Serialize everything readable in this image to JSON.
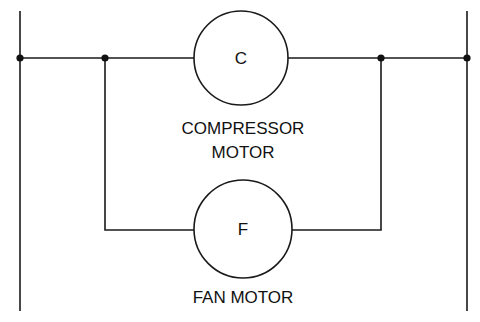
{
  "diagram": {
    "type": "ladder-schematic",
    "rails": {
      "left": "L1",
      "right": "L2"
    },
    "components": [
      {
        "id": "compressor",
        "symbol": "C",
        "label_line1": "COMPRESSOR",
        "label_line2": "MOTOR"
      },
      {
        "id": "fan",
        "symbol": "F",
        "label": "FAN MOTOR"
      }
    ],
    "connection": "parallel",
    "junction_nodes": 4
  }
}
